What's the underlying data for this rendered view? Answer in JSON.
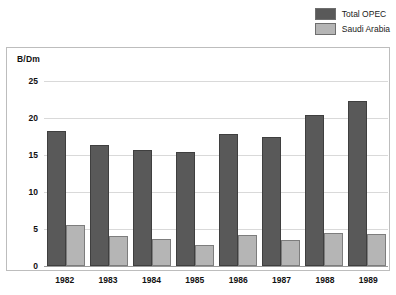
{
  "legend": {
    "position": "top-right",
    "entries": [
      {
        "label": "Total OPEC",
        "color": "#595959",
        "icon": "legend-swatch-icon"
      },
      {
        "label": "Saudi Arabia",
        "color": "#b5b5b5",
        "icon": "legend-swatch-icon"
      }
    ]
  },
  "axis": {
    "unit_label": "B/Dm",
    "yticks": [
      "25",
      "20",
      "15",
      "10",
      "5",
      "0"
    ],
    "xticks": [
      "1982",
      "1983",
      "1984",
      "1985",
      "1986",
      "1987",
      "1988",
      "1989"
    ]
  },
  "chart_data": {
    "type": "bar",
    "title": "",
    "subtitle": "",
    "xlabel": "",
    "ylabel": "B/Dm",
    "ylim": [
      0,
      25
    ],
    "yticks": [
      0,
      5,
      10,
      15,
      20,
      25
    ],
    "grid": true,
    "legend_position": "top-right",
    "categories": [
      "1982",
      "1983",
      "1984",
      "1985",
      "1986",
      "1987",
      "1988",
      "1989"
    ],
    "series": [
      {
        "name": "Total OPEC",
        "color": "#595959",
        "values": [
          18.2,
          16.3,
          15.7,
          15.4,
          17.8,
          17.4,
          20.4,
          22.3
        ]
      },
      {
        "name": "Saudi Arabia",
        "color": "#b5b5b5",
        "values": [
          5.6,
          4.0,
          3.6,
          2.8,
          4.2,
          3.5,
          4.4,
          4.3
        ]
      }
    ]
  }
}
